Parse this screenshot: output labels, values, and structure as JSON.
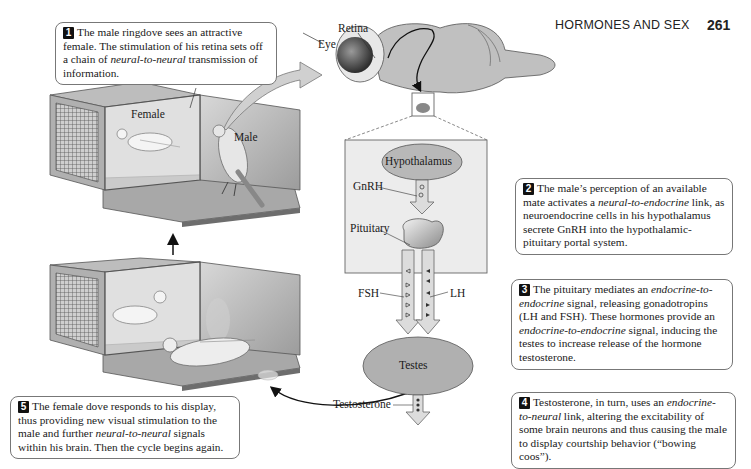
{
  "header": {
    "running_title": "HORMONES AND SEX",
    "page_number": "261"
  },
  "callouts": [
    {
      "number": "1",
      "parts": [
        {
          "text": "The male ringdove sees an attractive female. The stimulation of his retina sets off a chain of ",
          "italic": false
        },
        {
          "text": "neural-to-neural",
          "italic": true
        },
        {
          "text": " transmission of information.",
          "italic": false
        }
      ]
    },
    {
      "number": "2",
      "parts": [
        {
          "text": "The male’s perception of an available mate activates a ",
          "italic": false
        },
        {
          "text": "neural-to-endocrine",
          "italic": true
        },
        {
          "text": " link, as neuroendocrine cells in his hypothalamus secrete GnRH into the hypothalamic-pituitary portal system.",
          "italic": false
        }
      ]
    },
    {
      "number": "3",
      "parts": [
        {
          "text": "The pituitary mediates an ",
          "italic": false
        },
        {
          "text": "endocrine-to-endocrine",
          "italic": true
        },
        {
          "text": " signal, releasing gonadotropins (LH and FSH). These hormones provide an ",
          "italic": false
        },
        {
          "text": "endocrine-to-endocrine",
          "italic": true
        },
        {
          "text": " signal, inducing the testes to increase release of the hormone testosterone.",
          "italic": false
        }
      ]
    },
    {
      "number": "4",
      "parts": [
        {
          "text": "Testosterone, in turn, uses an ",
          "italic": false
        },
        {
          "text": "endocrine-to-neural",
          "italic": true
        },
        {
          "text": " link, altering the excitability of some brain neurons and thus causing the male to display courtship behavior (“bowing coos”).",
          "italic": false
        }
      ]
    },
    {
      "number": "5",
      "parts": [
        {
          "text": "The female dove responds to his display, thus providing new visual stimulation to the male and further ",
          "italic": false
        },
        {
          "text": "neural-to-neural",
          "italic": true
        },
        {
          "text": " signals within his brain. Then the cycle begins again.",
          "italic": false
        }
      ]
    }
  ],
  "labels": {
    "glass_barrier": "Glass barrier",
    "female": "Female",
    "male": "Male",
    "retina": "Retina",
    "eye": "Eye",
    "hypothalamus": "Hypothalamus",
    "gnrh": "GnRH",
    "pituitary": "Pituitary",
    "fsh": "FSH",
    "lh": "LH",
    "testes": "Testes",
    "testosterone": "Testosterone"
  },
  "colors": {
    "organ_fill": "#b8b8b8",
    "inset_fill": "#ececec",
    "arrow_fill": "#dcdcdc",
    "cage_dark": "#8a8a8a",
    "cage_light": "#c9c9c9"
  }
}
